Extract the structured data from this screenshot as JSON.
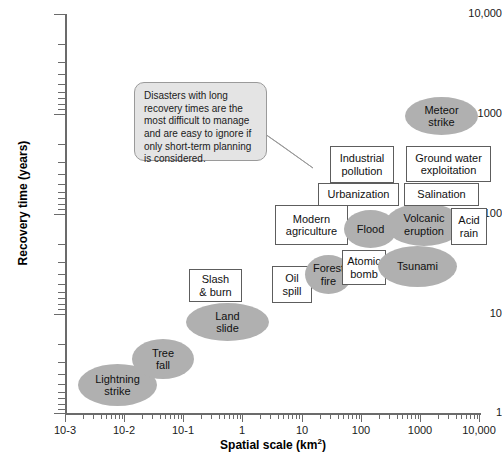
{
  "chart_data": {
    "type": "scatter",
    "title": "",
    "xlabel": "Spatial scale (km2)",
    "ylabel": "Recovery time (years)",
    "xticklabels": [
      "10-3",
      "10-2",
      "10-1",
      "1",
      "10",
      "100",
      "1000",
      "10,000"
    ],
    "yticklabels": [
      "1",
      "10",
      "100",
      "1000",
      "10,000"
    ],
    "xlim": [
      0.001,
      10000
    ],
    "ylim": [
      1,
      10000
    ],
    "xscale": "log",
    "yscale": "log",
    "grid": false,
    "legend": null,
    "annotation": "Disasters with long recovery times are the most difficult to manage and are easy to ignore if only short-term planning is considered.",
    "points": [
      {
        "label": "Lightning\nstrike",
        "shape": "ellipse",
        "x": 0.004,
        "y": 2
      },
      {
        "label": "Tree\nfall",
        "shape": "ellipse",
        "x": 0.03,
        "y": 3.5
      },
      {
        "label": "Land\nslide",
        "shape": "ellipse",
        "x": 0.45,
        "y": 10
      },
      {
        "label": "Slash\n& burn",
        "shape": "box",
        "x": 0.4,
        "y": 25
      },
      {
        "label": "Oil\nspill",
        "shape": "box",
        "x": 6,
        "y": 25
      },
      {
        "label": "Forest\nfire",
        "shape": "ellipse",
        "x": 20,
        "y": 28
      },
      {
        "label": "Atomic\nbomb",
        "shape": "box",
        "x": 60,
        "y": 30
      },
      {
        "label": "Tsunami",
        "shape": "ellipse",
        "x": 400,
        "y": 28
      },
      {
        "label": "Modern\nagriculture",
        "shape": "box",
        "x": 20,
        "y": 65
      },
      {
        "label": "Flood",
        "shape": "ellipse",
        "x": 90,
        "y": 60
      },
      {
        "label": "Volcanic\neruption",
        "shape": "ellipse",
        "x": 500,
        "y": 65
      },
      {
        "label": "Acid\nrain",
        "shape": "box",
        "x": 3000,
        "y": 60
      },
      {
        "label": "Urbanization",
        "shape": "box",
        "x": 80,
        "y": 120
      },
      {
        "label": "Salination",
        "shape": "box",
        "x": 2000,
        "y": 120
      },
      {
        "label": "Industrial\npollution",
        "shape": "box",
        "x": 180,
        "y": 220
      },
      {
        "label": "Ground water\nexploitation",
        "shape": "box",
        "x": 2500,
        "y": 250
      },
      {
        "label": "Meteor\nstrike",
        "shape": "ellipse",
        "x": 1500,
        "y": 1200
      }
    ]
  },
  "style": {
    "ellipse_fill": "#b0b0b0",
    "box_fill": "#ffffff",
    "box_border": "#5d5d5d",
    "axis_color": "#6b6b6b",
    "callout_fill": "#e4e4e4",
    "callout_border": "#9a9a9a",
    "text_color": "#111111"
  },
  "layout": {
    "marks": [
      {
        "name": "lightning-strike",
        "idx": 0,
        "left": 78,
        "top": 364,
        "w": 79,
        "h": 42
      },
      {
        "name": "tree-fall",
        "idx": 1,
        "left": 132,
        "top": 339,
        "w": 62,
        "h": 40
      },
      {
        "name": "land-slide",
        "idx": 2,
        "left": 186,
        "top": 303,
        "w": 83,
        "h": 38
      },
      {
        "name": "slash-and-burn",
        "idx": 3,
        "left": 189,
        "top": 269,
        "w": 53,
        "h": 33
      },
      {
        "name": "oil-spill",
        "idx": 4,
        "left": 272,
        "top": 266,
        "w": 40,
        "h": 37
      },
      {
        "name": "forest-fire",
        "idx": 5,
        "left": 305,
        "top": 255,
        "w": 47,
        "h": 39
      },
      {
        "name": "atomic-bomb",
        "idx": 6,
        "left": 342,
        "top": 250,
        "w": 44,
        "h": 35
      },
      {
        "name": "tsunami",
        "idx": 7,
        "left": 378,
        "top": 246,
        "w": 79,
        "h": 41
      },
      {
        "name": "modern-agriculture",
        "idx": 8,
        "left": 275,
        "top": 205,
        "w": 73,
        "h": 40
      },
      {
        "name": "flood",
        "idx": 9,
        "left": 344,
        "top": 210,
        "w": 53,
        "h": 38
      },
      {
        "name": "volcanic-eruption",
        "idx": 10,
        "left": 385,
        "top": 203,
        "w": 78,
        "h": 43
      },
      {
        "name": "acid-rain",
        "idx": 11,
        "left": 451,
        "top": 208,
        "w": 36,
        "h": 37
      },
      {
        "name": "urbanization",
        "idx": 12,
        "left": 318,
        "top": 183,
        "w": 81,
        "h": 23
      },
      {
        "name": "salination",
        "idx": 13,
        "left": 404,
        "top": 183,
        "w": 75,
        "h": 23
      },
      {
        "name": "industrial-pollution",
        "idx": 14,
        "left": 330,
        "top": 146,
        "w": 64,
        "h": 37
      },
      {
        "name": "ground-water-exploitation",
        "idx": 15,
        "left": 406,
        "top": 146,
        "w": 85,
        "h": 36
      },
      {
        "name": "meteor-strike",
        "idx": 16,
        "left": 405,
        "top": 97,
        "w": 73,
        "h": 38
      }
    ],
    "y_positions": [
      {
        "label": "10,000",
        "top": 14
      },
      {
        "label": "1000",
        "top": 114
      },
      {
        "label": "100",
        "top": 214
      },
      {
        "label": "10",
        "top": 314
      },
      {
        "label": "1",
        "top": 413
      }
    ],
    "x_positions": [
      {
        "label": "10-3",
        "left": 65
      },
      {
        "label": "10-2",
        "left": 124
      },
      {
        "label": "10-1",
        "left": 183
      },
      {
        "label": "1",
        "left": 242
      },
      {
        "label": "10",
        "left": 302
      },
      {
        "label": "100",
        "left": 361
      },
      {
        "label": "1000",
        "left": 420
      },
      {
        "label": "10,000",
        "left": 479
      }
    ]
  }
}
